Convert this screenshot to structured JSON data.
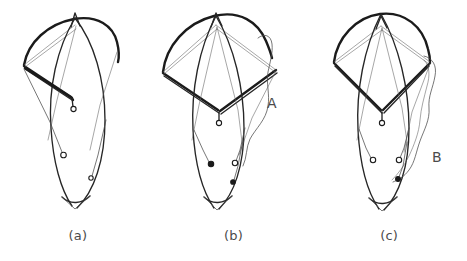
{
  "figure": {
    "background_color": "#ffffff",
    "ink_color": "#1b1b1b",
    "text_color": "#4b4b4b",
    "width": 467,
    "height": 261
  },
  "captions": [
    {
      "label": "(a)",
      "name": "panel-caption-a"
    },
    {
      "label": "(b)",
      "name": "panel-caption-b"
    },
    {
      "label": "(c)",
      "name": "panel-caption-c"
    }
  ],
  "annotations": [
    {
      "id": "A",
      "label": "A",
      "panel": "(b)",
      "x": 267,
      "y": 96
    },
    {
      "id": "B",
      "label": "B",
      "panel": "(c)",
      "x": 432,
      "y": 150
    }
  ],
  "panels": [
    {
      "id": "a",
      "caption": "(a)",
      "description": "Canopy tilted to the left; skirt arc drawn bold, body ellipse leaning, three suspension-line terminations",
      "node_count": 3
    },
    {
      "id": "b",
      "caption": "(b)",
      "description": "Canopy with rhombus bridle, wavy wake outline on the right labelled A, four suspension-line terminations",
      "node_count": 4
    },
    {
      "id": "c",
      "caption": "(c)",
      "description": "Symmetric canopy with rhombus bridle, wavy wake outline on the right labelled B, four suspension-line terminations",
      "node_count": 4
    }
  ]
}
